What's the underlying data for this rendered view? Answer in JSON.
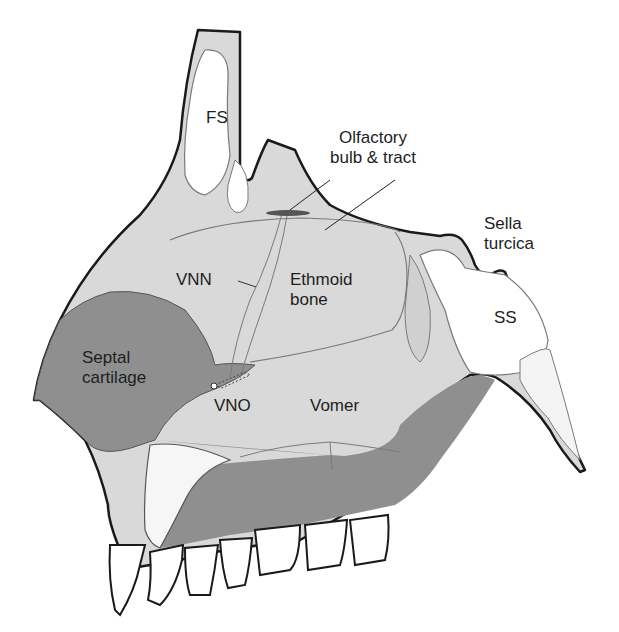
{
  "figure": {
    "colors": {
      "outline": "#1a1a1a",
      "bone_light": "#d6d6d6",
      "bone_lighter": "#e6e6e6",
      "cartilage_dark": "#8f8f8f",
      "sinus_white": "#ffffff",
      "inner_line": "#7a7a7a"
    }
  },
  "labels": {
    "fs": "FS",
    "olfactory": "Olfactory\nbulb & tract",
    "sella": "Sella\nturcica",
    "vnn": "VNN",
    "ethmoid": "Ethmoid\nbone",
    "ss": "SS",
    "septal": "Septal\ncartilage",
    "vno": "VNO",
    "vomer": "Vomer"
  }
}
